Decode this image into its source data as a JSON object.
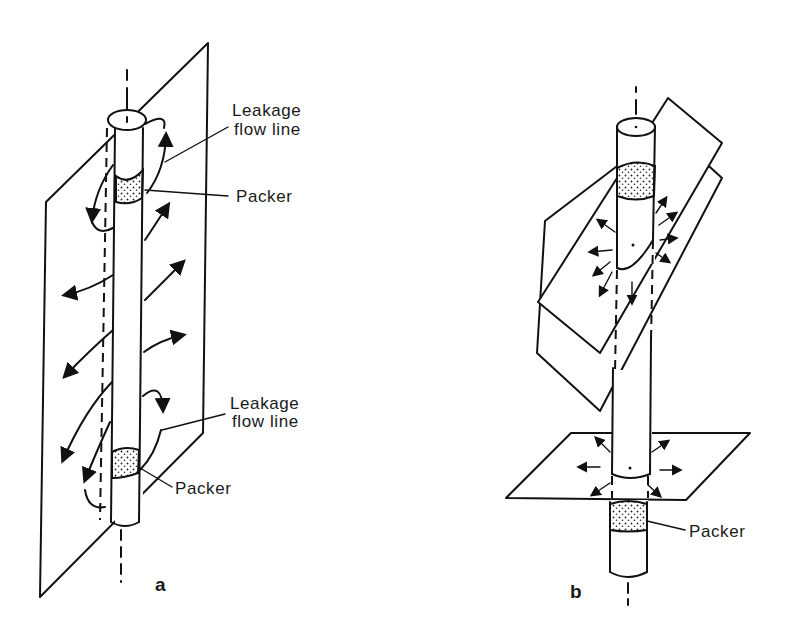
{
  "figure": {
    "panel_a": {
      "label": "a",
      "annotations": {
        "top_leakage_1": "Leakage",
        "top_leakage_2": "flow line",
        "top_packer": "Packer",
        "bottom_leakage_1": "Leakage",
        "bottom_leakage_2": "flow line",
        "bottom_packer": "Packer"
      }
    },
    "panel_b": {
      "label": "b",
      "annotations": {
        "packer": "Packer"
      }
    }
  },
  "colors": {
    "ink": "#111111",
    "background": "#ffffff"
  }
}
